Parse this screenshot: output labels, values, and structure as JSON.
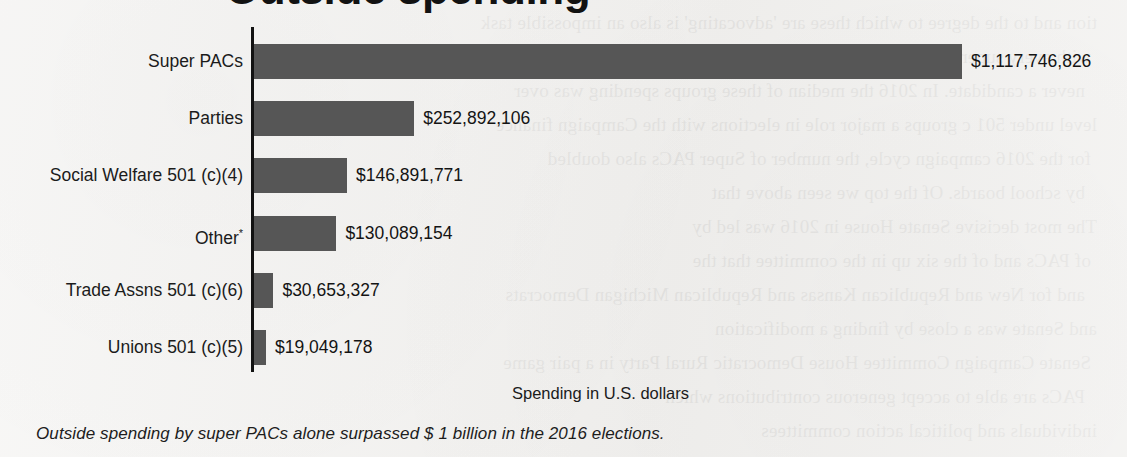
{
  "title": "Outside spending",
  "chart_data": {
    "type": "bar",
    "orientation": "horizontal",
    "title": "Outside spending",
    "xlabel": "Spending in U.S. dollars",
    "ylabel": "",
    "categories": [
      "Super PACs",
      "Parties",
      "Social Welfare 501 (c)(4)",
      "Other*",
      "Trade Assns 501 (c)(6)",
      "Unions 501 (c)(5)"
    ],
    "values": [
      1117746826,
      252892106,
      146891771,
      130089154,
      30653327,
      19049178
    ],
    "value_labels": [
      "$1,117,746,826",
      "$252,892,106",
      "$146,891,771",
      "$130,089,154",
      "$30,653,327",
      "$19,049,178"
    ],
    "xlim": [
      0,
      1117746826
    ],
    "grid": false,
    "legend": null,
    "bar_color": "#565656",
    "axis_color": "#121212"
  },
  "axis": {
    "x_title": "Spending in U.S. dollars"
  },
  "caption": "Outside spending by super PACs alone surpassed $ 1 billion in the 2016 elections.",
  "footnote_marker": "*",
  "background_bleed": [
    "tion and to the degree to which these are 'advocating' is also an impossible task",
    "with every super PACs spending and every dollar spent by each group has",
    "never a candidate. In 2016 the median of these groups spending was over",
    "level under 501 c groups a major role in elections with the Campaign finance",
    "for the 2016 campaign cycle, the number of Super PACs also doubled",
    "by school boards. Of the top we seen above that",
    "The most decisive Senate House in 2016 was led by",
    "of PACs and of the six up in the committee that the",
    "and for New and Republican Kansas and Republican Michigan Democrats",
    "and Senate was a close by finding a modification",
    "Senate Campaign Committee House Democratic Rural Party in a pair game",
    "PACs are able to accept generous contributions which",
    "individuals and political action committees"
  ]
}
